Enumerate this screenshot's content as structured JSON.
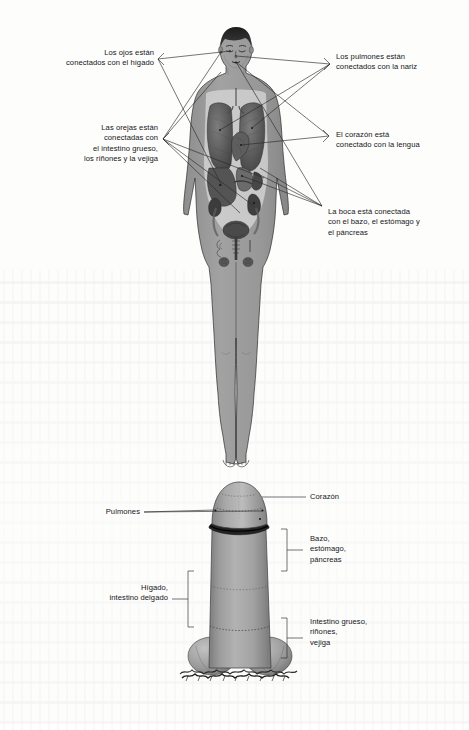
{
  "document": {
    "language": "es",
    "page_background": "#fdfdfc",
    "ink_color": "#15161a",
    "figure_fill": "#9a9a9a",
    "organ_dark": "#4c4c4c",
    "organ_mid": "#6e6e6e"
  },
  "figure_top": {
    "name": "human-anatomy-figure",
    "labels": {
      "eyes_liver": "Los ojos están\nconectados con el hígado",
      "ears_organs": "Las orejas están\nconectadas con\nel intestino grueso,\nlos riñones y la vejiga",
      "lungs_nose": "Los pulmones están\nconectados con la nariz",
      "heart_tongue": "El corazón está\nconectado con la lengua",
      "mouth_organs": "La boca está conectada\ncon el bazo, el estómago y\nel páncreas"
    }
  },
  "figure_bottom": {
    "name": "cylinder-tower-diagram",
    "labels": {
      "lungs": "Pulmones",
      "heart": "Corazón",
      "spleen_stomach_pancreas": "Bazo,\nestómago,\npáncreas",
      "liver_small_intestine": "Hígado,\nintestino delgado",
      "large_intestine_kidneys_bladder": "Intestino grueso,\nriñones,\nvejiga"
    }
  },
  "caption": {
    "text": ""
  }
}
